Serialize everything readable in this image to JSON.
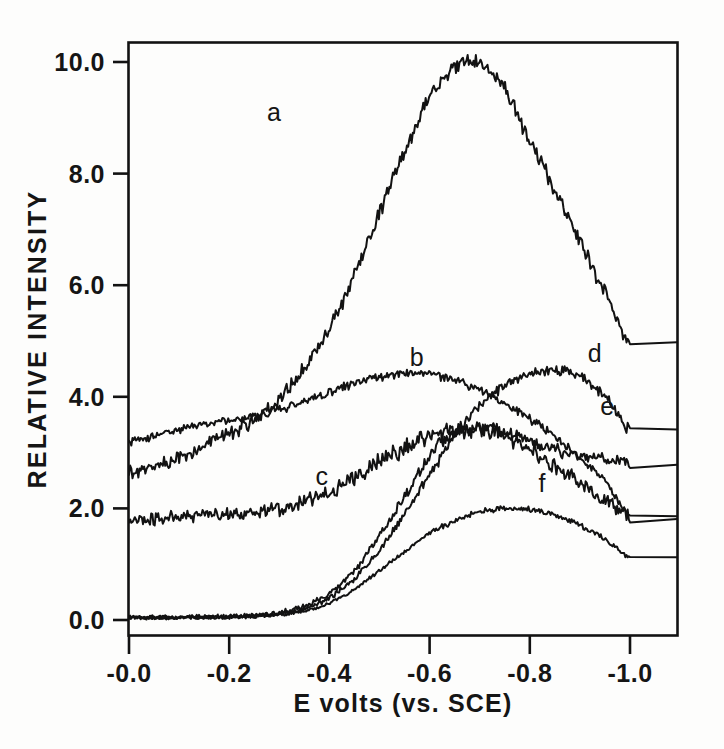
{
  "figure": {
    "background_color": "#fdfdfc",
    "ink_color": "#121212"
  },
  "chart_data": {
    "type": "line",
    "title": "",
    "subtitle": "",
    "xlabel": "E  volts (vs. SCE)",
    "ylabel": "RELATIVE INTENSITY",
    "xlim": [
      0.0,
      -1.0
    ],
    "ylim": [
      0.0,
      10.0
    ],
    "grid": false,
    "legend_position": "inline-curve-labels",
    "x_tick_labels": [
      "-0.0",
      "-0.2",
      "-0.4",
      "-0.6",
      "-0.8",
      "-1.0"
    ],
    "x_ticks": [
      0.0,
      -0.2,
      -0.4,
      -0.6,
      -0.8,
      -1.0
    ],
    "y_tick_labels": [
      "0.0",
      "2.0",
      "4.0",
      "6.0",
      "8.0",
      "10.0"
    ],
    "y_ticks": [
      0.0,
      2.0,
      4.0,
      6.0,
      8.0,
      10.0
    ],
    "x": [
      0.0,
      -0.05,
      -0.1,
      -0.15,
      -0.2,
      -0.25,
      -0.3,
      -0.35,
      -0.4,
      -0.45,
      -0.5,
      -0.55,
      -0.6,
      -0.65,
      -0.7,
      -0.75,
      -0.8,
      -0.85,
      -0.9,
      -0.95,
      -1.0
    ],
    "series": [
      {
        "name": "a",
        "label": "a",
        "label_x": -0.29,
        "label_y": 8.95,
        "noise": 0.09,
        "values": [
          2.65,
          2.75,
          2.9,
          3.1,
          3.35,
          3.6,
          3.95,
          4.5,
          5.2,
          6.2,
          7.3,
          8.4,
          9.35,
          9.9,
          10.0,
          9.5,
          8.6,
          7.7,
          6.8,
          5.85,
          5.0
        ]
      },
      {
        "name": "b",
        "label": "b",
        "label_x": -0.575,
        "label_y": 4.55,
        "noise": 0.05,
        "values": [
          3.2,
          3.3,
          3.4,
          3.5,
          3.58,
          3.66,
          3.78,
          3.92,
          4.08,
          4.25,
          4.36,
          4.42,
          4.4,
          4.3,
          4.12,
          3.88,
          3.6,
          3.28,
          2.9,
          2.5,
          1.85
        ]
      },
      {
        "name": "c",
        "label": "c",
        "label_x": -0.385,
        "label_y": 2.42,
        "noise": 0.1,
        "values": [
          1.75,
          1.82,
          1.86,
          1.88,
          1.9,
          1.94,
          2.0,
          2.12,
          2.3,
          2.55,
          2.82,
          3.08,
          3.28,
          3.4,
          3.4,
          3.3,
          3.05,
          2.75,
          2.45,
          2.15,
          1.85
        ]
      },
      {
        "name": "d",
        "label": "d",
        "label_x": -0.93,
        "label_y": 4.63,
        "noise": 0.06,
        "values": [
          0.05,
          0.05,
          0.05,
          0.05,
          0.06,
          0.08,
          0.12,
          0.2,
          0.4,
          0.75,
          1.25,
          1.9,
          2.6,
          3.3,
          3.85,
          4.2,
          4.4,
          4.45,
          4.38,
          4.0,
          3.4
        ]
      },
      {
        "name": "e",
        "label": "e",
        "label_x": -0.955,
        "label_y": 3.68,
        "noise": 0.07,
        "values": [
          0.05,
          0.05,
          0.05,
          0.05,
          0.06,
          0.08,
          0.13,
          0.24,
          0.48,
          0.9,
          1.5,
          2.2,
          2.95,
          3.35,
          3.45,
          3.38,
          3.2,
          3.05,
          2.95,
          2.88,
          2.82
        ]
      },
      {
        "name": "f",
        "label": "f",
        "label_x": -0.825,
        "label_y": 2.3,
        "noise": 0.04,
        "values": [
          0.04,
          0.04,
          0.04,
          0.04,
          0.05,
          0.06,
          0.09,
          0.16,
          0.3,
          0.55,
          0.88,
          1.22,
          1.55,
          1.78,
          1.93,
          2.0,
          1.98,
          1.88,
          1.7,
          1.45,
          1.12
        ]
      }
    ]
  }
}
